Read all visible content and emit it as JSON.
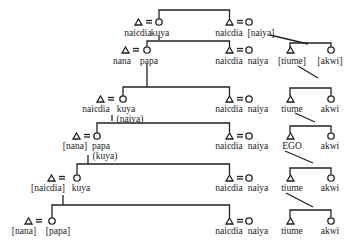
{
  "diagram": {
    "type": "kinship-genealogy",
    "symbols": {
      "male": "triangle",
      "female": "circle",
      "marriage": "="
    },
    "generations": [
      {
        "left_couple": {
          "husband": "naicdia",
          "wife": "kuya"
        },
        "right_couple": {
          "husband": "naicdia",
          "wife": "[naiya]"
        }
      },
      {
        "left_couple": {
          "husband": "nana",
          "wife": "papa"
        },
        "right_couple": {
          "husband": "naicdia",
          "wife": "naiya"
        },
        "siblings": {
          "brother": "[tiume]",
          "sister": "[akwi]"
        }
      },
      {
        "left_couple": {
          "husband": "naicdia",
          "wife": "kuya",
          "wife_alt": "(naiya)"
        },
        "right_couple": {
          "husband": "naicdia",
          "wife": "naiya"
        },
        "siblings": {
          "brother": "tiume",
          "sister": "akwi"
        }
      },
      {
        "left_couple": {
          "husband": "[nana]",
          "wife": "papa",
          "wife_alt": "(kuya)"
        },
        "right_couple": {
          "husband": "naicdia",
          "wife": "naiya"
        },
        "siblings": {
          "brother": "EGO",
          "sister": "akwi"
        }
      },
      {
        "left_couple": {
          "husband": "[naicdia]",
          "wife": "kuya"
        },
        "right_couple": {
          "husband": "naicdia",
          "wife": "naiya"
        },
        "siblings": {
          "brother": "tiume",
          "sister": "akwi"
        }
      },
      {
        "left_couple": {
          "husband": "[nana]",
          "wife": "[papa]"
        },
        "right_couple": {
          "husband": "naicdia",
          "wife": "naiya"
        },
        "siblings": {
          "brother": "tiume",
          "sister": "akwi"
        }
      }
    ]
  }
}
